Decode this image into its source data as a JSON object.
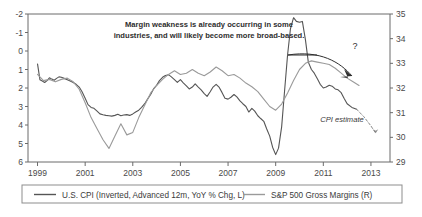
{
  "chart_data": {
    "type": "line",
    "title": "",
    "subtitle": "",
    "xlabel": "",
    "ylabel_left": "U.S. CPI (Inverted, Advanced 12m, YoY % Chg)",
    "ylabel_right": "S&P 500 Gross Margins (%)",
    "grid": false,
    "legend_position": "bottom",
    "x_ticks": [
      "1999",
      "2001",
      "2003",
      "2005",
      "2007",
      "2009",
      "2011",
      "2013"
    ],
    "x_tick_values": [
      1999,
      2001,
      2003,
      2005,
      2007,
      2009,
      2011,
      2013
    ],
    "xlim": [
      1998.6,
      2013.8
    ],
    "left_axis": {
      "ticks": [
        "-2",
        "-1",
        "0",
        "1",
        "2",
        "3",
        "4",
        "5",
        "6"
      ],
      "tick_values": [
        -2,
        -1,
        0,
        1,
        2,
        3,
        4,
        5,
        6
      ],
      "ylim": [
        -2,
        6
      ],
      "inverted": true
    },
    "right_axis": {
      "ticks": [
        "35",
        "34",
        "33",
        "32",
        "31",
        "30",
        "29"
      ],
      "tick_values": [
        35,
        34,
        33,
        32,
        31,
        30,
        29
      ],
      "ylim": [
        29,
        35
      ],
      "inverted": false
    },
    "series": [
      {
        "name": "U.S. CPI (Inverted, Advanced 12m, YoY % Chg, L)",
        "axis": "left",
        "color": "#555555",
        "style": "solid",
        "x": [
          1999.0,
          1999.1,
          1999.2,
          1999.3,
          1999.4,
          1999.5,
          1999.6,
          1999.7,
          1999.8,
          1999.9,
          2000.0,
          2000.12,
          2000.25,
          2000.37,
          2000.5,
          2000.62,
          2000.75,
          2000.87,
          2001.0,
          2001.12,
          2001.25,
          2001.37,
          2001.5,
          2001.62,
          2001.75,
          2001.87,
          2002.0,
          2002.12,
          2002.25,
          2002.37,
          2002.5,
          2002.62,
          2002.75,
          2002.87,
          2003.0,
          2003.12,
          2003.25,
          2003.37,
          2003.5,
          2003.62,
          2003.75,
          2003.87,
          2004.0,
          2004.12,
          2004.25,
          2004.37,
          2004.5,
          2004.62,
          2004.75,
          2004.87,
          2005.0,
          2005.12,
          2005.25,
          2005.37,
          2005.5,
          2005.62,
          2005.75,
          2005.87,
          2006.0,
          2006.12,
          2006.25,
          2006.37,
          2006.5,
          2006.62,
          2006.75,
          2006.87,
          2007.0,
          2007.12,
          2007.25,
          2007.37,
          2007.5,
          2007.62,
          2007.75,
          2007.87,
          2008.0,
          2008.12,
          2008.25,
          2008.37,
          2008.5,
          2008.62,
          2008.75,
          2008.87,
          2009.0,
          2009.12,
          2009.25,
          2009.37,
          2009.5,
          2009.62,
          2009.75,
          2009.87,
          2010.0,
          2010.12,
          2010.25,
          2010.37,
          2010.5,
          2010.62,
          2010.75,
          2010.87,
          2011.0,
          2011.12,
          2011.25,
          2011.37,
          2011.5,
          2011.62,
          2011.75,
          2011.87,
          2012.0,
          2012.2,
          2012.4
        ],
        "y": [
          0.7,
          1.55,
          1.62,
          1.7,
          1.6,
          1.45,
          1.52,
          1.58,
          1.48,
          1.4,
          1.42,
          1.48,
          1.55,
          1.62,
          1.7,
          1.8,
          1.95,
          2.2,
          2.55,
          2.9,
          3.05,
          3.1,
          3.25,
          3.4,
          3.45,
          3.48,
          3.5,
          3.52,
          3.48,
          3.42,
          3.5,
          3.46,
          3.44,
          3.48,
          3.4,
          3.3,
          3.2,
          3.05,
          2.85,
          2.6,
          2.35,
          2.05,
          1.85,
          1.6,
          1.42,
          1.32,
          1.28,
          1.4,
          1.55,
          1.7,
          1.55,
          1.72,
          1.88,
          2.05,
          1.95,
          1.78,
          1.95,
          2.1,
          2.3,
          2.45,
          2.2,
          1.95,
          1.8,
          1.95,
          2.25,
          2.55,
          2.6,
          2.5,
          2.35,
          2.48,
          2.7,
          2.85,
          3.0,
          3.3,
          3.1,
          3.25,
          3.5,
          3.65,
          3.8,
          4.2,
          4.6,
          5.2,
          5.6,
          5.25,
          4.1,
          2.2,
          0.2,
          -1.2,
          -1.8,
          -1.6,
          -1.55,
          -1.6,
          -0.6,
          0.6,
          1.0,
          1.2,
          1.5,
          1.8,
          2.0,
          1.95,
          1.85,
          1.9,
          2.05,
          2.1,
          2.25,
          2.55,
          2.85,
          3.05,
          3.15
        ]
      },
      {
        "name": "S&P 500 Gross Margins (R)",
        "axis": "right",
        "color": "#9a9a9a",
        "style": "solid",
        "x": [
          1999.0,
          1999.25,
          1999.5,
          1999.75,
          2000.0,
          2000.25,
          2000.5,
          2000.75,
          2001.0,
          2001.25,
          2001.5,
          2001.75,
          2002.0,
          2002.25,
          2002.5,
          2002.75,
          2003.0,
          2003.25,
          2003.5,
          2003.75,
          2004.0,
          2004.25,
          2004.5,
          2004.75,
          2005.0,
          2005.25,
          2005.5,
          2005.75,
          2006.0,
          2006.25,
          2006.5,
          2006.75,
          2007.0,
          2007.25,
          2007.5,
          2007.75,
          2008.0,
          2008.25,
          2008.5,
          2008.75,
          2009.0,
          2009.25,
          2009.5,
          2009.75,
          2010.0,
          2010.25,
          2010.5,
          2010.75,
          2011.0,
          2011.25,
          2011.5,
          2011.75,
          2012.0,
          2012.25,
          2012.5
        ],
        "y": [
          32.55,
          32.3,
          32.35,
          32.25,
          32.35,
          32.4,
          32.25,
          31.95,
          31.4,
          30.8,
          30.35,
          29.9,
          29.55,
          30.05,
          30.55,
          30.1,
          30.2,
          30.8,
          31.3,
          31.8,
          32.1,
          32.35,
          32.55,
          32.7,
          32.55,
          32.6,
          32.75,
          32.6,
          32.5,
          32.65,
          32.85,
          32.7,
          32.5,
          32.55,
          32.4,
          32.2,
          32.05,
          31.85,
          31.55,
          31.25,
          31.1,
          31.35,
          31.8,
          32.3,
          32.75,
          33.0,
          33.1,
          33.05,
          33.0,
          32.95,
          32.8,
          32.6,
          32.4,
          32.25,
          32.1
        ]
      },
      {
        "name": "CPI estimate",
        "axis": "left",
        "color": "#8a8a8a",
        "style": "dashed",
        "x": [
          2012.4,
          2012.7,
          2013.0,
          2013.2
        ],
        "y": [
          3.15,
          3.55,
          4.05,
          4.45
        ]
      }
    ],
    "annotations": [
      {
        "id": "margin-weakness-note",
        "text_line1": "Margin weakness is already occurring in some",
        "text_line2": "industries, and will likely become more broad-based."
      },
      {
        "id": "question-mark",
        "text": "?"
      },
      {
        "id": "cpi-estimate-label",
        "text": "CPI estimate"
      }
    ]
  },
  "legend": {
    "items": [
      {
        "label": "U.S. CPI (Inverted, Advanced 12m, YoY % Chg, L)",
        "color": "#555555"
      },
      {
        "label": "S&P 500 Gross Margins (R)",
        "color": "#9a9a9a"
      }
    ]
  },
  "colors": {
    "cpi_line": "#555555",
    "margins_line": "#9a9a9a",
    "estimate_line": "#8a8a8a",
    "axis": "#6b6b6b",
    "text": "#3b3b3b",
    "background": "#ffffff"
  }
}
